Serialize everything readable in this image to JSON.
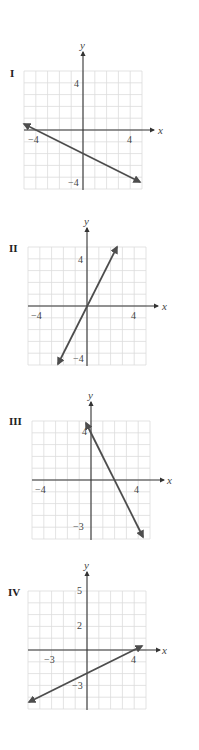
{
  "chart_data": [
    {
      "type": "line",
      "id": "graph-I",
      "title": "I",
      "xlabel": "x",
      "ylabel": "y",
      "xlim": [
        -5,
        5
      ],
      "ylim": [
        -5,
        5
      ],
      "grid": true,
      "x_tick_labels": [
        "-4",
        "4"
      ],
      "y_tick_labels": [
        "4",
        "-4"
      ],
      "equation": "y = -x/2 - 2",
      "slope": -0.5,
      "intercept": -2,
      "x": [
        -5,
        4.8
      ],
      "y": [
        0.5,
        -4.4
      ]
    },
    {
      "type": "line",
      "id": "graph-II",
      "title": "II",
      "xlabel": "x",
      "ylabel": "y",
      "xlim": [
        -5,
        5
      ],
      "ylim": [
        -5,
        5
      ],
      "grid": true,
      "x_tick_labels": [
        "-4",
        "4"
      ],
      "y_tick_labels": [
        "4",
        "-4"
      ],
      "equation": "y = 2x",
      "slope": 2,
      "intercept": 0,
      "x": [
        -2.45,
        2.5
      ],
      "y": [
        -4.9,
        5.0
      ]
    },
    {
      "type": "line",
      "id": "graph-III",
      "title": "III",
      "xlabel": "x",
      "ylabel": "y",
      "xlim": [
        -5,
        5
      ],
      "ylim": [
        -5,
        5
      ],
      "grid": true,
      "x_tick_labels": [
        "-4",
        "4"
      ],
      "y_tick_labels": [
        "4",
        "-3"
      ],
      "equation": "y = -2x + 4",
      "slope": -2,
      "intercept": 4,
      "x": [
        -0.4,
        4.4
      ],
      "y": [
        4.8,
        -4.8
      ]
    },
    {
      "type": "line",
      "id": "graph-IV",
      "title": "IV",
      "xlabel": "x",
      "ylabel": "y",
      "xlim": [
        -5,
        5
      ],
      "ylim": [
        -5,
        5
      ],
      "grid": true,
      "x_tick_labels": [
        "-3",
        "4"
      ],
      "y_tick_labels": [
        "5",
        "2",
        "-3"
      ],
      "equation": "y = x/2 - 2",
      "slope": 0.5,
      "intercept": -2,
      "x": [
        -4.9,
        4.6
      ],
      "y": [
        -4.45,
        0.3
      ]
    }
  ],
  "graphs": [
    {
      "label": "I",
      "xlabel": "x",
      "ylabel": "y",
      "ticks": {
        "y_top": "4",
        "x_left": "−4",
        "x_right": "4",
        "y_bottom": "−4"
      }
    },
    {
      "label": "II",
      "xlabel": "x",
      "ylabel": "y",
      "ticks": {
        "y_top": "4",
        "x_left": "−4",
        "x_right": "4",
        "y_bottom": "−4"
      }
    },
    {
      "label": "III",
      "xlabel": "x",
      "ylabel": "y",
      "ticks": {
        "y_top": "4",
        "x_left": "−4",
        "x_right": "4",
        "y_bottom": "−3"
      }
    },
    {
      "label": "IV",
      "xlabel": "x",
      "ylabel": "y",
      "ticks": {
        "y_top": "5",
        "y_mid": "2",
        "x_left": "−3",
        "x_right": "4",
        "y_bottom": "−3"
      }
    }
  ],
  "colors": {
    "line": "#4d4d4d",
    "grid": "#dcdcdc",
    "axis": "#333333"
  }
}
